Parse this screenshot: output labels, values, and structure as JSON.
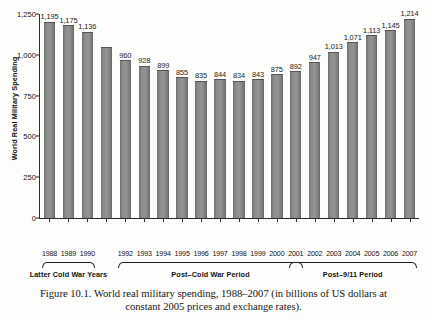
{
  "figure": {
    "caption_line1": "Figure 10.1.  World real military spending, 1988–2007 (in billions of US dollars at",
    "caption_line2": "constant 2005 prices and exchange rates)."
  },
  "chart_data": {
    "type": "bar",
    "title": "",
    "xlabel": "",
    "ylabel": "World Real Military Spending",
    "ylim": [
      0,
      1250
    ],
    "yticks": [
      0,
      250,
      500,
      750,
      1000,
      1250
    ],
    "ytick_labels": [
      "0",
      "250",
      "500",
      "750",
      "1,000",
      "1,250"
    ],
    "grid": false,
    "legend": null,
    "bar_color": "#8b8b8b",
    "categories": [
      "1988",
      "1989",
      "1990",
      "1991",
      "1992",
      "1993",
      "1994",
      "1995",
      "1996",
      "1997",
      "1998",
      "1999",
      "2000",
      "2001",
      "2002",
      "2003",
      "2004",
      "2005",
      "2006",
      "2007"
    ],
    "tick_labels_shown": [
      "1988",
      "1989",
      "1990",
      "",
      "1992",
      "1993",
      "1994",
      "1995",
      "1996",
      "1997",
      "1998",
      "1999",
      "2000",
      "2001",
      "2002",
      "2003",
      "2004",
      "2005",
      "2006",
      "2007"
    ],
    "values": [
      1195,
      1175,
      1136,
      1040,
      960,
      928,
      899,
      855,
      835,
      844,
      834,
      843,
      875,
      892,
      947,
      1013,
      1071,
      1113,
      1145,
      1214
    ],
    "value_labels": [
      "1,195",
      "1,175",
      "1,136",
      "",
      "960",
      "928",
      "899",
      "855",
      "835",
      "844",
      "834",
      "843",
      "875",
      "892",
      "947",
      "1,013",
      "1,071",
      "1,113",
      "1,145",
      "1,214"
    ],
    "annotations": [
      {
        "label": "Latter Cold War Years",
        "start_index": 0,
        "end_index": 2
      },
      {
        "label": "Post–Cold War Period",
        "start_index": 4,
        "end_index": 13
      },
      {
        "label": "Post–9/11 Period",
        "start_index": 13,
        "end_index": 19
      }
    ]
  }
}
